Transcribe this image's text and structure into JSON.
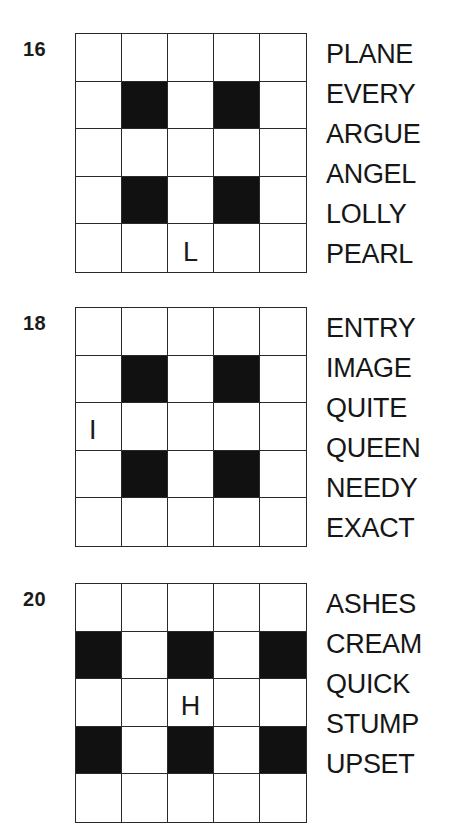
{
  "puzzles": [
    {
      "number": "16",
      "top": 33,
      "rows": [
        [
          {
            "b": 0,
            "t": ""
          },
          {
            "b": 0,
            "t": ""
          },
          {
            "b": 0,
            "t": ""
          },
          {
            "b": 0,
            "t": ""
          },
          {
            "b": 0,
            "t": ""
          }
        ],
        [
          {
            "b": 0,
            "t": ""
          },
          {
            "b": 1,
            "t": ""
          },
          {
            "b": 0,
            "t": ""
          },
          {
            "b": 1,
            "t": ""
          },
          {
            "b": 0,
            "t": ""
          }
        ],
        [
          {
            "b": 0,
            "t": ""
          },
          {
            "b": 0,
            "t": ""
          },
          {
            "b": 0,
            "t": ""
          },
          {
            "b": 0,
            "t": ""
          },
          {
            "b": 0,
            "t": ""
          }
        ],
        [
          {
            "b": 0,
            "t": ""
          },
          {
            "b": 1,
            "t": ""
          },
          {
            "b": 0,
            "t": ""
          },
          {
            "b": 1,
            "t": ""
          },
          {
            "b": 0,
            "t": ""
          }
        ],
        [
          {
            "b": 0,
            "t": ""
          },
          {
            "b": 0,
            "t": ""
          },
          {
            "b": 0,
            "t": "L"
          },
          {
            "b": 0,
            "t": ""
          },
          {
            "b": 0,
            "t": ""
          }
        ]
      ],
      "words": [
        "PLANE",
        "EVERY",
        "ARGUE",
        "ANGEL",
        "LOLLY",
        "PEARL"
      ]
    },
    {
      "number": "18",
      "top": 307,
      "rows": [
        [
          {
            "b": 0,
            "t": ""
          },
          {
            "b": 0,
            "t": ""
          },
          {
            "b": 0,
            "t": ""
          },
          {
            "b": 0,
            "t": ""
          },
          {
            "b": 0,
            "t": ""
          }
        ],
        [
          {
            "b": 0,
            "t": ""
          },
          {
            "b": 1,
            "t": ""
          },
          {
            "b": 0,
            "t": ""
          },
          {
            "b": 1,
            "t": ""
          },
          {
            "b": 0,
            "t": ""
          }
        ],
        [
          {
            "b": 0,
            "t": "I",
            "left": true
          },
          {
            "b": 0,
            "t": ""
          },
          {
            "b": 0,
            "t": ""
          },
          {
            "b": 0,
            "t": ""
          },
          {
            "b": 0,
            "t": ""
          }
        ],
        [
          {
            "b": 0,
            "t": ""
          },
          {
            "b": 1,
            "t": ""
          },
          {
            "b": 0,
            "t": ""
          },
          {
            "b": 1,
            "t": ""
          },
          {
            "b": 0,
            "t": ""
          }
        ],
        [
          {
            "b": 0,
            "t": ""
          },
          {
            "b": 0,
            "t": ""
          },
          {
            "b": 0,
            "t": ""
          },
          {
            "b": 0,
            "t": ""
          },
          {
            "b": 0,
            "t": ""
          }
        ]
      ],
      "words": [
        "ENTRY",
        "IMAGE",
        "QUITE",
        "QUEEN",
        "NEEDY",
        "EXACT"
      ]
    },
    {
      "number": "20",
      "top": 583,
      "rows": [
        [
          {
            "b": 0,
            "t": ""
          },
          {
            "b": 0,
            "t": ""
          },
          {
            "b": 0,
            "t": ""
          },
          {
            "b": 0,
            "t": ""
          },
          {
            "b": 0,
            "t": ""
          }
        ],
        [
          {
            "b": 1,
            "t": ""
          },
          {
            "b": 0,
            "t": ""
          },
          {
            "b": 1,
            "t": ""
          },
          {
            "b": 0,
            "t": ""
          },
          {
            "b": 1,
            "t": ""
          }
        ],
        [
          {
            "b": 0,
            "t": ""
          },
          {
            "b": 0,
            "t": ""
          },
          {
            "b": 0,
            "t": "H"
          },
          {
            "b": 0,
            "t": ""
          },
          {
            "b": 0,
            "t": ""
          }
        ],
        [
          {
            "b": 1,
            "t": ""
          },
          {
            "b": 0,
            "t": ""
          },
          {
            "b": 1,
            "t": ""
          },
          {
            "b": 0,
            "t": ""
          },
          {
            "b": 1,
            "t": ""
          }
        ],
        [
          {
            "b": 0,
            "t": ""
          },
          {
            "b": 0,
            "t": ""
          },
          {
            "b": 0,
            "t": ""
          },
          {
            "b": 0,
            "t": ""
          },
          {
            "b": 0,
            "t": ""
          }
        ]
      ],
      "words": [
        "ASHES",
        "CREAM",
        "QUICK",
        "STUMP",
        "UPSET"
      ]
    }
  ],
  "colors": {
    "block": "#111111",
    "line": "#2a2a2a",
    "text": "#161616",
    "background": "#ffffff"
  }
}
